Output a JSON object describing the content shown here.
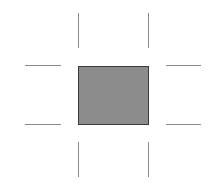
{
  "diagram": {
    "box": {
      "fill": "#8c8c8c",
      "stroke": "#3a3a3a"
    },
    "mark_color": "#8a8a8a",
    "marks": [
      {
        "name": "crop-mark-top-left",
        "orient": "v",
        "x": 78,
        "y": 13,
        "len": 35
      },
      {
        "name": "crop-mark-top-right",
        "orient": "v",
        "x": 148,
        "y": 13,
        "len": 35
      },
      {
        "name": "crop-mark-bottom-left",
        "orient": "v",
        "x": 78,
        "y": 142,
        "len": 35
      },
      {
        "name": "crop-mark-bottom-right",
        "orient": "v",
        "x": 148,
        "y": 142,
        "len": 35
      },
      {
        "name": "crop-mark-left-top",
        "orient": "h",
        "x": 25,
        "y": 65,
        "len": 36
      },
      {
        "name": "crop-mark-left-bottom",
        "orient": "h",
        "x": 25,
        "y": 124,
        "len": 36
      },
      {
        "name": "crop-mark-right-top",
        "orient": "h",
        "x": 166,
        "y": 65,
        "len": 35
      },
      {
        "name": "crop-mark-right-bottom",
        "orient": "h",
        "x": 166,
        "y": 124,
        "len": 35
      }
    ]
  }
}
